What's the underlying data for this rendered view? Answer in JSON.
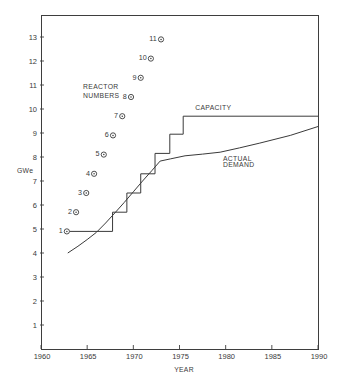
{
  "figure": {
    "xlabel": "YEAR",
    "ylabel": "GWe"
  },
  "colors": {
    "line": "#3a3a3a",
    "text": "#3a3a3a",
    "background": "#ffffff"
  },
  "chart_data": {
    "type": "line",
    "title": "",
    "xlabel": "YEAR",
    "ylabel": "GWe",
    "xlim": [
      1960,
      1990
    ],
    "ylim": [
      0,
      13.9
    ],
    "grid": false,
    "xticks": [
      1960,
      1965,
      1970,
      1975,
      1980,
      1985,
      1990
    ],
    "yticks": [
      1,
      2,
      3,
      4,
      5,
      6,
      7,
      8,
      9,
      10,
      11,
      12,
      13
    ],
    "series": [
      {
        "name": "CAPACITY",
        "type": "step",
        "points": [
          [
            1963.1,
            4.9
          ],
          [
            1967.75,
            4.9
          ],
          [
            1967.75,
            5.7
          ],
          [
            1969.3,
            5.7
          ],
          [
            1969.3,
            6.5
          ],
          [
            1970.8,
            6.5
          ],
          [
            1970.8,
            7.3
          ],
          [
            1972.35,
            7.3
          ],
          [
            1972.35,
            8.15
          ],
          [
            1973.95,
            8.15
          ],
          [
            1973.95,
            8.95
          ],
          [
            1975.4,
            8.95
          ],
          [
            1975.4,
            9.7
          ],
          [
            1990,
            9.7
          ]
        ]
      },
      {
        "name": "ACTUAL DEMAND",
        "type": "line",
        "points": [
          [
            1962.9,
            4.0
          ],
          [
            1964,
            4.28
          ],
          [
            1965,
            4.56
          ],
          [
            1966,
            4.86
          ],
          [
            1967,
            5.25
          ],
          [
            1968,
            5.67
          ],
          [
            1969,
            6.1
          ],
          [
            1970,
            6.55
          ],
          [
            1971,
            7.0
          ],
          [
            1972,
            7.43
          ],
          [
            1972.9,
            7.83
          ],
          [
            1974,
            7.92
          ],
          [
            1975.6,
            8.05
          ],
          [
            1977.5,
            8.12
          ],
          [
            1979.4,
            8.2
          ],
          [
            1981.5,
            8.38
          ],
          [
            1983.7,
            8.58
          ],
          [
            1987,
            8.9
          ],
          [
            1990,
            9.27
          ]
        ]
      },
      {
        "name": "REACTOR NUMBERS",
        "type": "scatter",
        "points": [
          {
            "label": "1",
            "x": 1962.8,
            "y": 4.9
          },
          {
            "label": "2",
            "x": 1963.8,
            "y": 5.7
          },
          {
            "label": "3",
            "x": 1964.9,
            "y": 6.5
          },
          {
            "label": "4",
            "x": 1965.75,
            "y": 7.3
          },
          {
            "label": "5",
            "x": 1966.8,
            "y": 8.1
          },
          {
            "label": "6",
            "x": 1967.8,
            "y": 8.9
          },
          {
            "label": "7",
            "x": 1968.8,
            "y": 9.7
          },
          {
            "label": "8",
            "x": 1969.75,
            "y": 10.5
          },
          {
            "label": "9",
            "x": 1970.8,
            "y": 11.3
          },
          {
            "label": "10",
            "x": 1971.9,
            "y": 12.1
          },
          {
            "label": "11",
            "x": 1973.0,
            "y": 12.9
          }
        ]
      }
    ],
    "annotations": [
      {
        "text": "REACTOR",
        "x": 1964.55,
        "y": 10.92
      },
      {
        "text": "NUMBERS",
        "x": 1964.55,
        "y": 10.58
      },
      {
        "text": "CAPACITY",
        "x": 1976.7,
        "y": 10.05
      },
      {
        "text": "ACTUAL",
        "x": 1979.7,
        "y": 7.94
      },
      {
        "text": "DEMAND",
        "x": 1979.7,
        "y": 7.67
      }
    ]
  }
}
